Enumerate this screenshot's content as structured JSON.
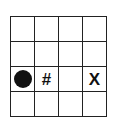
{
  "grid": {
    "rows": 4,
    "cols": 4,
    "cells": [
      [
        "",
        "",
        "",
        ""
      ],
      [
        "",
        "",
        "",
        ""
      ],
      [
        "circle",
        "#",
        "",
        "X"
      ],
      [
        "",
        "",
        "",
        ""
      ]
    ]
  },
  "symbols": {
    "r2c1": "#",
    "r2c3": "X"
  },
  "colors": {
    "line": "#222222",
    "ink": "#111111",
    "background": "#ffffff"
  }
}
